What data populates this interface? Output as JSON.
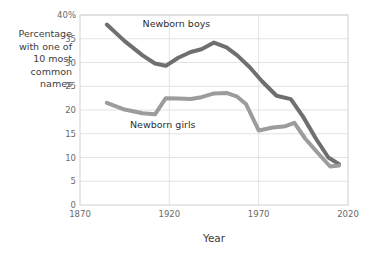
{
  "chart_data": {
    "type": "line",
    "title": "",
    "xlabel": "Year",
    "ylabel": "Percentage with one of 10 most common names",
    "ylabel_lines": [
      "Percentage",
      "with one of",
      "10 most",
      "common",
      "names"
    ],
    "xlim": [
      1870,
      2020
    ],
    "ylim": [
      0,
      40
    ],
    "xticks": [
      1870,
      1920,
      1970,
      2020
    ],
    "xticklabels": [
      "1870",
      "1920",
      "1970",
      "2020"
    ],
    "yticks": [
      0,
      5,
      10,
      15,
      20,
      25,
      30,
      35,
      40
    ],
    "yticklabels": [
      "0",
      "5",
      "10",
      "15",
      "20",
      "25",
      "30",
      "35",
      "40%"
    ],
    "grid": "horizontal-and-vertical",
    "legend_position": "inline-annotations",
    "series": [
      {
        "name": "Newborn boys",
        "color": "#6f6f6f",
        "label_x": 1905,
        "label_y": 38.2,
        "x": [
          1885,
          1895,
          1905,
          1912,
          1918,
          1925,
          1932,
          1938,
          1945,
          1952,
          1958,
          1965,
          1972,
          1980,
          1988,
          1995,
          2002,
          2009,
          2015
        ],
        "values": [
          38.0,
          34.5,
          31.5,
          29.8,
          29.3,
          31.0,
          32.2,
          32.8,
          34.2,
          33.2,
          31.5,
          29.0,
          26.0,
          23.0,
          22.3,
          18.5,
          14.0,
          10.0,
          8.6
        ]
      },
      {
        "name": "Newborn girls",
        "color": "#9c9c9c",
        "label_x": 1898,
        "label_y": 16.8,
        "x": [
          1885,
          1895,
          1905,
          1912,
          1918,
          1925,
          1932,
          1938,
          1945,
          1952,
          1958,
          1963,
          1970,
          1978,
          1985,
          1990,
          1996,
          2003,
          2010,
          2015
        ],
        "values": [
          21.5,
          20.1,
          19.3,
          19.1,
          22.5,
          22.4,
          22.3,
          22.7,
          23.5,
          23.6,
          22.8,
          21.2,
          15.7,
          16.3,
          16.6,
          17.3,
          14.0,
          11.0,
          8.1,
          8.3
        ]
      }
    ]
  }
}
